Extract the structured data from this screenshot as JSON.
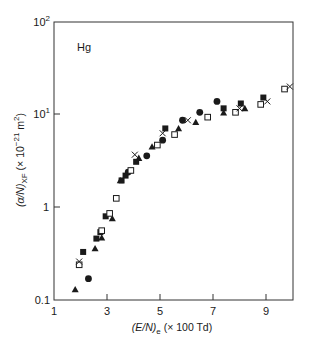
{
  "chart_data": {
    "type": "scatter",
    "title": "",
    "annotation": "Hg",
    "xlabel": "(E/N)e (× 100 Td)",
    "ylabel": "(α/N)XF (× 10^-21 m^2)",
    "xscale": "linear",
    "yscale": "log",
    "xlim": [
      1,
      10
    ],
    "ylim": [
      0.1,
      100
    ],
    "xticks": [
      1,
      3,
      5,
      7,
      9
    ],
    "xtick_labels": [
      "1",
      "3",
      "5",
      "7",
      "9"
    ],
    "yticks": [
      0.1,
      1,
      10,
      100
    ],
    "ytick_labels": [
      "0.1",
      "1",
      "10¹",
      "10²"
    ],
    "grid": false,
    "legend": null,
    "series": [
      {
        "name": "filled-triangle",
        "marker": "triangle-filled",
        "x": [
          1.8,
          2.55,
          2.8,
          3.2,
          3.5,
          4.2,
          4.7,
          5.7,
          6.35,
          7.4,
          8.2
        ],
        "y": [
          0.13,
          0.36,
          0.47,
          0.76,
          1.95,
          3.4,
          4.5,
          7.1,
          8.3,
          10.5,
          11.7
        ]
      },
      {
        "name": "filled-square",
        "marker": "square-filled",
        "x": [
          2.1,
          2.6,
          2.75,
          2.95,
          3.55,
          3.7,
          4.1,
          5.2,
          7.4,
          8.05,
          8.9
        ],
        "y": [
          0.33,
          0.46,
          0.54,
          0.8,
          1.95,
          2.2,
          3.1,
          7.1,
          11.7,
          13.2,
          15.3
        ]
      },
      {
        "name": "filled-circle",
        "marker": "circle-filled",
        "x": [
          2.3,
          3.8,
          4.5,
          5.1,
          5.85,
          6.5,
          7.15
        ],
        "y": [
          0.17,
          2.4,
          3.6,
          5.3,
          8.7,
          10.6,
          13.9
        ]
      },
      {
        "name": "open-square",
        "marker": "square-open",
        "x": [
          1.95,
          2.8,
          3.1,
          3.35,
          3.9,
          4.9,
          5.55,
          6.8,
          7.85,
          8.8,
          9.7
        ],
        "y": [
          0.24,
          0.56,
          0.86,
          1.25,
          2.5,
          4.7,
          6.1,
          9.4,
          10.6,
          12.9,
          18.9
        ]
      },
      {
        "name": "cross",
        "marker": "x",
        "x": [
          1.95,
          4.05,
          5.1,
          6.05,
          8.0,
          9.05,
          9.9
        ],
        "y": [
          0.26,
          3.7,
          6.3,
          8.7,
          11.7,
          13.9,
          20.1
        ]
      }
    ]
  },
  "labels": {
    "annotation": "Hg",
    "xlabel_prefix": "(E/N)",
    "xlabel_sub": "e",
    "xlabel_suffix": " (× 100 Td)",
    "ylabel_prefix": "(α/N)",
    "ylabel_sub": "XF",
    "ylabel_suffix": " (× 10",
    "ylabel_exp": "−21",
    "ylabel_unit": " m",
    "ylabel_unit_exp": "2",
    "ylabel_close": ")",
    "ytick_0": "0.1",
    "ytick_1": "1",
    "ytick_10_base": "10",
    "ytick_10_exp": "1",
    "ytick_100_base": "10",
    "ytick_100_exp": "2"
  },
  "colors": {
    "ink": "#1a1a1a",
    "background": "#ffffff"
  }
}
